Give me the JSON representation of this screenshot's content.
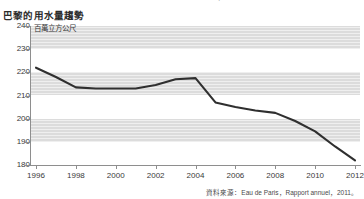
{
  "top_caption": "Annual   water   volume   consumption   and   water   network   loss",
  "title": "巴黎的用水量趨勢",
  "unit_label": "百萬立方公尺",
  "source_note": "資料來源：Eau de Paris，Rapport annuel，2011。",
  "colors": {
    "line": "#2f2f2f",
    "band": "#dcdcdc",
    "axis": "#8e8e8e",
    "text": "#3a3a3a",
    "background": "#ffffff"
  },
  "chart_data": {
    "type": "line",
    "title": "巴黎的用水量趨勢",
    "xlabel": "",
    "ylabel": "百萬立方公尺",
    "xlim": [
      1996,
      2012
    ],
    "ylim": [
      175,
      240
    ],
    "ytick_values": [
      240,
      230,
      220,
      210,
      200,
      190,
      180
    ],
    "ytick_labels": [
      "240",
      "230",
      "220",
      "210",
      "200",
      "190",
      "180"
    ],
    "xtick_values": [
      1996,
      1998,
      2000,
      2002,
      2004,
      2006,
      2008,
      2010,
      2012
    ],
    "xtick_labels": [
      "1996",
      "1998",
      "2000",
      "2002",
      "2004",
      "2006",
      "2008",
      "2010",
      "2012"
    ],
    "grid": "horizontal-bands",
    "legend": "none",
    "series": [
      {
        "name": "巴黎用水量",
        "x": [
          1996,
          1997,
          1998,
          1999,
          2000,
          2001,
          2002,
          2003,
          2004,
          2005,
          2006,
          2007,
          2008,
          2009,
          2010,
          2011,
          2012
        ],
        "values": [
          222,
          218,
          213.5,
          213,
          213,
          213,
          214.5,
          217,
          217.5,
          207,
          205,
          203.5,
          202.5,
          199,
          194.5,
          188,
          182
        ]
      }
    ]
  }
}
